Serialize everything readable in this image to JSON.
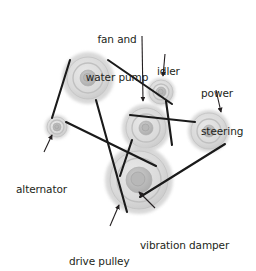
{
  "diagram": {
    "background_color": "#ffffff",
    "text_color": "#231f20",
    "belt_color": "#1a1a1a",
    "pulley_fill": "#d9d9d9",
    "pulley_shadow": "#c9c9c9",
    "pulley_hub": "#b5b5b5",
    "labels": [
      {
        "id": "fan-and-water-pump",
        "text": "fan and\nwater pump",
        "line1": "fan and",
        "line2": "water pump",
        "x": 101,
        "y": 8,
        "align": "center"
      },
      {
        "id": "idler",
        "text": "idler",
        "line1": "idler",
        "line2": "",
        "x": 157,
        "y": 40,
        "align": "left"
      },
      {
        "id": "power-steering",
        "text": "power\nsteering",
        "line1": "power",
        "line2": "steering",
        "x": 201,
        "y": 62,
        "align": "left"
      },
      {
        "id": "alternator",
        "text": "alternator",
        "line1": "alternator",
        "line2": "",
        "x": 16,
        "y": 158,
        "align": "left"
      },
      {
        "id": "drive-pulley",
        "text": "drive pulley",
        "line1": "drive pulley",
        "line2": "",
        "x": 69,
        "y": 230,
        "align": "left"
      },
      {
        "id": "vibration-damper",
        "text": "vibration damper",
        "line1": "vibration damper",
        "line2": "",
        "x": 140,
        "y": 214,
        "align": "left"
      }
    ],
    "pulleys": [
      {
        "id": "top-left-pulley",
        "name": "fan-drive-upper-pulley",
        "cx": 88,
        "cy": 78,
        "r_outer": 26,
        "r_rim": 21,
        "r_face": 15,
        "r_hub": 8,
        "r_bolt": 4
      },
      {
        "id": "alternator-pulley",
        "name": "alternator",
        "cx": 57,
        "cy": 127,
        "r_outer": 12,
        "r_rim": 10,
        "r_face": 7,
        "r_hub": 4,
        "r_bolt": 2
      },
      {
        "id": "idler-pulley",
        "name": "idler",
        "cx": 161,
        "cy": 92,
        "r_outer": 14,
        "r_rim": 12,
        "r_face": 8,
        "r_hub": 5,
        "r_bolt": 2.5
      },
      {
        "id": "fan-water-pump-pulley",
        "name": "fan-and-water-pump",
        "cx": 146,
        "cy": 128,
        "r_outer": 24,
        "r_rim": 20,
        "r_face": 14,
        "r_hub": 7,
        "r_bolt": 3.5
      },
      {
        "id": "power-steering-pulley",
        "name": "power-steering",
        "cx": 209,
        "cy": 131,
        "r_outer": 21,
        "r_rim": 18,
        "r_face": 12,
        "r_hub": 6,
        "r_bolt": 3
      },
      {
        "id": "damper-pulley",
        "name": "vibration-damper",
        "cx": 139,
        "cy": 180,
        "r_outer": 34,
        "r_rim": 29,
        "r_face": 22,
        "r_hub": 13,
        "r_bolt": 7
      }
    ],
    "belt_segments": [
      {
        "id": "seg-topleft-to-idler",
        "x1": 108,
        "y1": 60,
        "x2": 172,
        "y2": 104
      },
      {
        "id": "seg-topleft-to-alternator",
        "x1": 70,
        "y1": 60,
        "x2": 52,
        "y2": 118
      },
      {
        "id": "seg-alternator-to-damper",
        "x1": 66,
        "y1": 122,
        "x2": 156,
        "y2": 166
      },
      {
        "id": "seg-topleft-to-damper",
        "x1": 96,
        "y1": 100,
        "x2": 127,
        "y2": 212
      },
      {
        "id": "seg-fanpump-to-powersteer",
        "x1": 130,
        "y1": 115,
        "x2": 195,
        "y2": 122
      },
      {
        "id": "seg-idler-to-fanpump-right",
        "x1": 166,
        "y1": 101,
        "x2": 172,
        "y2": 145
      },
      {
        "id": "seg-fanpump-to-damper-left",
        "x1": 132,
        "y1": 140,
        "x2": 120,
        "y2": 176
      },
      {
        "id": "seg-powersteer-to-damper",
        "x1": 225,
        "y1": 144,
        "x2": 140,
        "y2": 197
      }
    ],
    "leader_lines": [
      {
        "id": "leader-fan-and-water-pump",
        "x1": 142,
        "y1": 36,
        "x2": 143,
        "y2": 101,
        "arrow": true
      },
      {
        "id": "leader-idler",
        "x1": 165,
        "y1": 54,
        "x2": 163,
        "y2": 76,
        "arrow": true
      },
      {
        "id": "leader-power-steering",
        "x1": 216,
        "y1": 90,
        "x2": 221,
        "y2": 112,
        "arrow": true
      },
      {
        "id": "leader-alternator",
        "x1": 44,
        "y1": 152,
        "x2": 52,
        "y2": 135,
        "arrow": true
      },
      {
        "id": "leader-drive-pulley",
        "x1": 110,
        "y1": 226,
        "x2": 119,
        "y2": 205,
        "arrow": true
      },
      {
        "id": "leader-vibration-damper",
        "x1": 155,
        "y1": 208,
        "x2": 139,
        "y2": 192,
        "arrow": true
      }
    ]
  }
}
